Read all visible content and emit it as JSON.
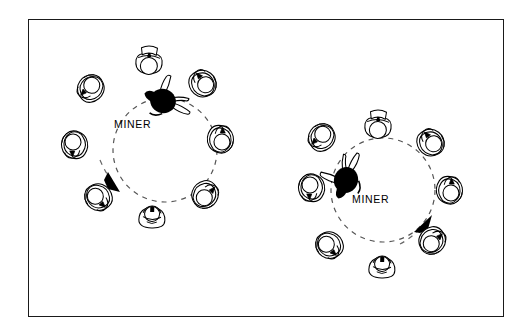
{
  "image": {
    "title": "MINER circle formation diagram",
    "background_color": "#ffffff",
    "ink_color": "#000000",
    "frame": {
      "border_color": "#1a1a1a",
      "x": 28,
      "y": 19,
      "width": 476,
      "height": 298,
      "stroke": 1.6
    }
  },
  "diagrams": [
    {
      "id": "left-formation",
      "label": "MINER",
      "label_x": 114,
      "label_y": 118,
      "circle": {
        "cx": 165,
        "cy": 150,
        "r": 52,
        "dashed": true,
        "dash": "5 5"
      },
      "direction": "clockwise",
      "arrow": {
        "id": "clockwise-arrow",
        "tip_x": 116,
        "tip_y": 189,
        "angle_deg": 50,
        "description": "arrow pointing down-right indicating clockwise rotation"
      },
      "center_figure": {
        "id": "miner-figure-left",
        "x": 162,
        "y": 100,
        "fill": "#000000",
        "rotation": 205,
        "description": "dark silhouette figure lying across the circle edge"
      },
      "ring_figures": [
        {
          "id": "figure-l1",
          "x": 149,
          "y": 62,
          "rotation": 180,
          "pose": "standing-front"
        },
        {
          "id": "figure-l2",
          "x": 204,
          "y": 83,
          "rotation": 225,
          "pose": "kneeling"
        },
        {
          "id": "figure-l3",
          "x": 222,
          "y": 140,
          "rotation": 270,
          "pose": "kneeling"
        },
        {
          "id": "figure-l4",
          "x": 205,
          "y": 197,
          "rotation": 315,
          "pose": "kneeling"
        },
        {
          "id": "figure-l5",
          "x": 152,
          "y": 216,
          "rotation": 0,
          "pose": "standing-back"
        },
        {
          "id": "figure-l6",
          "x": 96,
          "y": 197,
          "rotation": 45,
          "pose": "kneeling"
        },
        {
          "id": "figure-l7",
          "x": 73,
          "y": 143,
          "rotation": 90,
          "pose": "kneeling"
        },
        {
          "id": "figure-l8",
          "x": 91,
          "y": 86,
          "rotation": 135,
          "pose": "kneeling"
        }
      ]
    },
    {
      "id": "right-formation",
      "label": "MINER",
      "label_x": 352,
      "label_y": 193,
      "circle": {
        "cx": 383,
        "cy": 190,
        "r": 52,
        "dashed": true,
        "dash": "5 5"
      },
      "direction": "counterclockwise",
      "arrow": {
        "id": "counterclockwise-arrow",
        "tip_x": 430,
        "tip_y": 220,
        "angle_deg": -55,
        "description": "arrow pointing up-right indicating counterclockwise rotation"
      },
      "center_figure": {
        "id": "miner-figure-right",
        "x": 345,
        "y": 180,
        "fill": "#000000",
        "rotation": 110,
        "description": "dark silhouette figure lying across the left circle edge"
      },
      "ring_figures": [
        {
          "id": "figure-r1",
          "x": 378,
          "y": 126,
          "rotation": 180,
          "pose": "standing-front"
        },
        {
          "id": "figure-r2",
          "x": 433,
          "y": 143,
          "rotation": 225,
          "pose": "kneeling"
        },
        {
          "id": "figure-r3",
          "x": 451,
          "y": 192,
          "rotation": 270,
          "pose": "kneeling"
        },
        {
          "id": "figure-r4",
          "x": 432,
          "y": 243,
          "rotation": 315,
          "pose": "kneeling"
        },
        {
          "id": "figure-r5",
          "x": 382,
          "y": 266,
          "rotation": 0,
          "pose": "standing-back"
        },
        {
          "id": "figure-r6",
          "x": 327,
          "y": 245,
          "rotation": 45,
          "pose": "kneeling"
        },
        {
          "id": "figure-r7",
          "x": 310,
          "y": 186,
          "rotation": 90,
          "pose": "kneeling"
        },
        {
          "id": "figure-r8",
          "x": 322,
          "y": 135,
          "rotation": 135,
          "pose": "kneeling"
        }
      ]
    }
  ]
}
